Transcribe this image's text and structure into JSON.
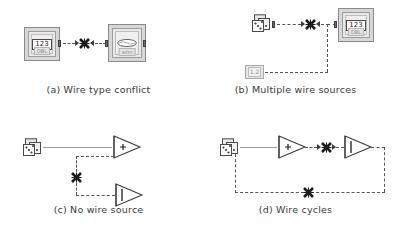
{
  "figure": {
    "background": "#ffffff",
    "wire_color_broken": "#555555",
    "wire_color_valid": "#9a9a9a",
    "marker_color": "#1b1b1b"
  },
  "panels": [
    {
      "id": "a",
      "caption": "(a) Wire type conflict",
      "nodes": [
        {
          "name": "numeric-control-node",
          "icon": "numeric-indicator-icon",
          "chip_label": "123",
          "sub_label": "DBL"
        },
        {
          "name": "waveform-node",
          "icon": "waveform-chart-icon",
          "chip_label": "",
          "sub_label": "wfm"
        }
      ],
      "wire": {
        "style": "dashed",
        "state": "broken",
        "marker": "x-error-marker",
        "arrows": [
          "right",
          "left"
        ]
      }
    },
    {
      "id": "b",
      "caption": "(b) Multiple wire sources",
      "nodes": [
        {
          "name": "random-number-node",
          "icon": "dice-icon",
          "chip_label": "",
          "sub_label": ""
        },
        {
          "name": "numeric-indicator-node",
          "icon": "numeric-indicator-icon",
          "chip_label": "123",
          "sub_label": "DBL"
        },
        {
          "name": "constant-node",
          "icon": "numeric-constant-icon",
          "chip_label": "1.2",
          "sub_label": ""
        }
      ],
      "wire": {
        "style": "dashed",
        "state": "broken",
        "marker": "x-error-marker",
        "arrows": [
          "right",
          "left"
        ]
      }
    },
    {
      "id": "c",
      "caption": "(c) No wire source",
      "nodes": [
        {
          "name": "random-number-node",
          "icon": "dice-icon",
          "chip_label": "",
          "sub_label": ""
        },
        {
          "name": "add-function-node",
          "icon": "triangle-plus-icon",
          "chip_label": "+",
          "sub_label": ""
        },
        {
          "name": "unary-function-node",
          "icon": "triangle-bar-icon",
          "chip_label": "|",
          "sub_label": ""
        }
      ],
      "wire": {
        "style": "dashed",
        "state": "broken",
        "marker": "x-error-marker",
        "arrows": []
      }
    },
    {
      "id": "d",
      "caption": "(d) Wire cycles",
      "nodes": [
        {
          "name": "random-number-node",
          "icon": "dice-icon",
          "chip_label": "",
          "sub_label": ""
        },
        {
          "name": "add-function-node",
          "icon": "triangle-plus-icon",
          "chip_label": "+",
          "sub_label": ""
        },
        {
          "name": "unary-function-node",
          "icon": "triangle-bar-icon",
          "chip_label": "|",
          "sub_label": ""
        }
      ],
      "wire": {
        "style": "dashed",
        "state": "broken",
        "marker": "x-error-marker",
        "arrows": [
          "right",
          "right"
        ]
      }
    }
  ]
}
